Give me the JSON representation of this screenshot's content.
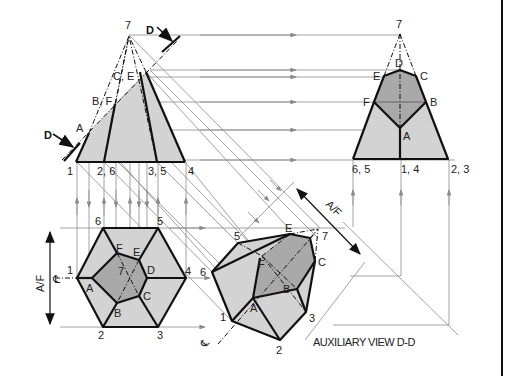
{
  "caption": "AUXILIARY VIEW D-D",
  "dimension_label": "A/F",
  "centerline_symbol": "℄",
  "section_marker": "D",
  "front_view": {
    "apex": "7",
    "cut_points": [
      "A",
      "B, F",
      "C, E"
    ],
    "base_points": [
      "1",
      "2, 6",
      "3, 5",
      "4"
    ]
  },
  "side_view": {
    "apex": "7",
    "top_points": [
      "D",
      "E",
      "C",
      "F",
      "B",
      "A"
    ],
    "base_points": [
      "6, 5",
      "1, 4",
      "2, 3"
    ]
  },
  "top_view": {
    "outer_points": [
      "1",
      "2",
      "3",
      "4",
      "5",
      "6"
    ],
    "inner_points": [
      "A",
      "B",
      "C",
      "D",
      "E",
      "F"
    ],
    "center": "7"
  },
  "auxiliary_view": {
    "points": [
      "1",
      "2",
      "3",
      "5",
      "6",
      "A",
      "B",
      "C",
      "E",
      "F",
      "7"
    ]
  },
  "colors": {
    "light_fill": "#d3d3d3",
    "dark_fill": "#a9a9a9",
    "line": "#111111",
    "projection": "#8a8a8a"
  }
}
